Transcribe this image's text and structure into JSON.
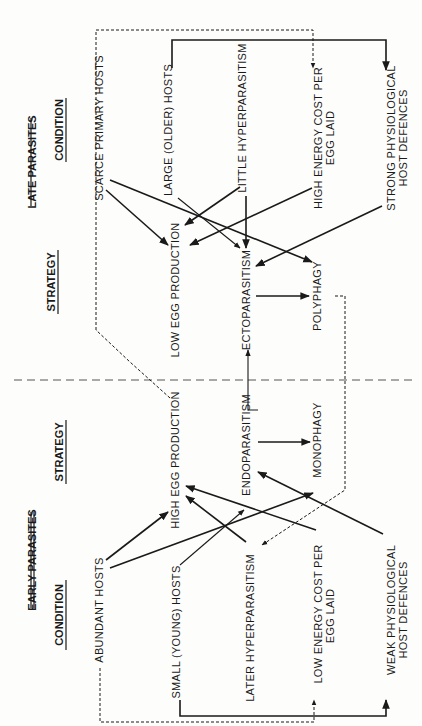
{
  "sections": {
    "early": {
      "title": "EARLY PARASITES",
      "condition_header": "CONDITION",
      "strategy_header": "STRATEGY",
      "conditions": {
        "abundant_hosts": "ABUNDANT   HOSTS",
        "small_hosts": "SMALL  (YOUNG)  HOSTS",
        "later_hyper": "LATER   HYPERPARASITISM",
        "low_energy_1": "LOW   ENERGY    COST     PER",
        "low_energy_2": "EGG     LAID",
        "weak_def_1": "WEAK   PHYSIOLOGICAL",
        "weak_def_2": "HOST  DEFENCES"
      },
      "strategies": {
        "high_egg": "HIGH   EGG   PRODUCTION",
        "endo": "ENDOPARASITISM",
        "mono": "MONOPHAGY"
      }
    },
    "late": {
      "title": "LATE PARASITES",
      "condition_header": "CONDITION",
      "strategy_header": "STRATEGY",
      "conditions": {
        "scarce_hosts": "SCARCE  PRIMARY  HOSTS",
        "large_hosts": "LARGE  (OLDER)  HOSTS",
        "little_hyper": "LITTLE   HYPERPARASITISM",
        "high_energy_1": "HIGH   ENERGY   COST   PER",
        "high_energy_2": "EGG    LAID",
        "strong_def_1": "STRONG  PHYSIOLOGICAL",
        "strong_def_2": "HOST   DEFENCES"
      },
      "strategies": {
        "low_egg": "LOW   EGG   PRODUCTION",
        "ecto": "ECTOPARASITISM",
        "poly": "POLYPHAGY"
      }
    }
  },
  "colors": {
    "ink": "#1a1a1a",
    "paper": "#fdfdfb"
  }
}
